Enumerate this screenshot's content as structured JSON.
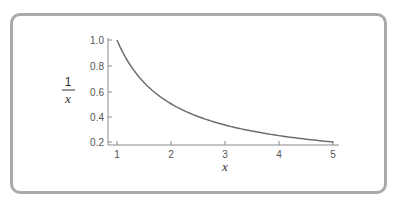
{
  "chart_data": {
    "type": "line",
    "title": "",
    "xlabel": "x",
    "ylabel": "1/x",
    "ylabel_numerator": "1",
    "ylabel_denominator": "x",
    "xlim": [
      1,
      5
    ],
    "ylim": [
      0.2,
      1.0
    ],
    "x_ticks": [
      "1",
      "2",
      "3",
      "4",
      "5"
    ],
    "y_ticks": [
      "1.0",
      "0.8",
      "0.6",
      "0.4",
      "0.2"
    ],
    "grid": false,
    "legend": null,
    "series": [
      {
        "name": "1/x",
        "x": [
          1,
          1.25,
          1.5,
          1.75,
          2,
          2.5,
          3,
          3.5,
          4,
          4.5,
          5
        ],
        "y": [
          1.0,
          0.8,
          0.667,
          0.571,
          0.5,
          0.4,
          0.333,
          0.286,
          0.25,
          0.222,
          0.2
        ]
      }
    ],
    "colors": {
      "curve": "#6e6e6e",
      "axis": "#8a8a8a",
      "frame": "#a9a9a9"
    }
  }
}
